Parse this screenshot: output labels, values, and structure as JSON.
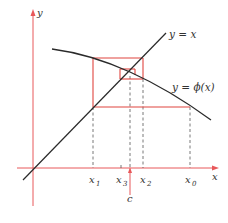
{
  "diagram": {
    "colors": {
      "axis": "#e8585a",
      "curve": "#2a2a2a",
      "cobweb": "#e0443f",
      "dashed": "#555555",
      "text": "#333333"
    },
    "axes": {
      "x_label": "x",
      "y_label": "y"
    },
    "curves": [
      {
        "id": "line",
        "label": "y  =  x"
      },
      {
        "id": "phi",
        "label": "y  =  ϕ(x)"
      }
    ],
    "x_ticks": [
      {
        "base": "x",
        "sub": "1"
      },
      {
        "base": "x",
        "sub": "3"
      },
      {
        "base": "x",
        "sub": "2"
      },
      {
        "base": "x",
        "sub": "0"
      }
    ],
    "fixed_point_label": "c"
  }
}
